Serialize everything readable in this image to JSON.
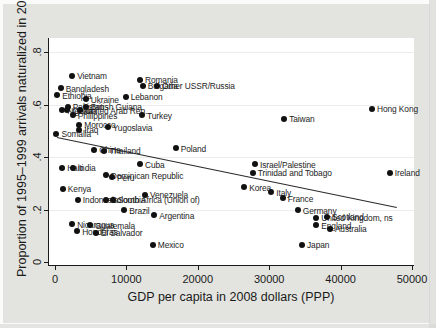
{
  "chart_data": {
    "type": "scatter",
    "title": "",
    "xlabel": "GDP per capita in 2008 dollars (PPP)",
    "ylabel": "Proportion of 1995–1999 arrivals naturalized in 2007",
    "xlim": [
      0,
      50000
    ],
    "ylim": [
      0,
      0.86
    ],
    "grid": "horizontal-faint",
    "x_ticks": {
      "values": [
        0,
        10000,
        20000,
        30000,
        40000,
        50000
      ],
      "labels": [
        "0",
        "10000",
        "20000",
        "30000",
        "40000",
        "50000"
      ]
    },
    "y_ticks": {
      "values": [
        0,
        0.2,
        0.4,
        0.6,
        0.8
      ],
      "labels": [
        "0",
        ".2",
        ".4",
        ".6",
        ".8"
      ]
    },
    "marker": {
      "shape": "filled-circle",
      "color": "#111111"
    },
    "points": [
      {
        "label": "Vietnam",
        "x": 2400,
        "y": 0.71
      },
      {
        "label": "Romania",
        "x": 11900,
        "y": 0.695
      },
      {
        "label": "Bulgaria",
        "x": 12300,
        "y": 0.672
      },
      {
        "label": "Other USSR/Russia",
        "x": 14300,
        "y": 0.672
      },
      {
        "label": "Bangladesh",
        "x": 800,
        "y": 0.664
      },
      {
        "label": "Ethiopia",
        "x": 300,
        "y": 0.637
      },
      {
        "label": "Ukraine",
        "x": 4300,
        "y": 0.622
      },
      {
        "label": "Lebanon",
        "x": 9900,
        "y": 0.63
      },
      {
        "label": "Pakistan",
        "x": 1800,
        "y": 0.592
      },
      {
        "label": "British Guiana",
        "x": 4300,
        "y": 0.592
      },
      {
        "label": "Nigeria",
        "x": 1000,
        "y": 0.58
      },
      {
        "label": "Ghana",
        "x": 1700,
        "y": 0.58
      },
      {
        "label": "United Arab Rep.",
        "x": 3500,
        "y": 0.58
      },
      {
        "label": "Philippines",
        "x": 2500,
        "y": 0.561
      },
      {
        "label": "Turkey",
        "x": 12200,
        "y": 0.561
      },
      {
        "label": "Morocco",
        "x": 3400,
        "y": 0.523
      },
      {
        "label": "Iraq",
        "x": 3400,
        "y": 0.504
      },
      {
        "label": "Yugoslavia",
        "x": 7400,
        "y": 0.515
      },
      {
        "label": "Somalia",
        "x": 200,
        "y": 0.489
      },
      {
        "label": "China",
        "x": 5500,
        "y": 0.428
      },
      {
        "label": "Thailand",
        "x": 6900,
        "y": 0.424
      },
      {
        "label": "Poland",
        "x": 16900,
        "y": 0.435
      },
      {
        "label": "Hong Kong",
        "x": 44400,
        "y": 0.584
      },
      {
        "label": "Taiwan",
        "x": 32100,
        "y": 0.546
      },
      {
        "label": "Cuba",
        "x": 11900,
        "y": 0.374
      },
      {
        "label": "Haiti",
        "x": 1000,
        "y": 0.359
      },
      {
        "label": "India",
        "x": 2500,
        "y": 0.359
      },
      {
        "label": "Dominican Republic",
        "x": 7100,
        "y": 0.332
      },
      {
        "label": "Peru",
        "x": 8000,
        "y": 0.324
      },
      {
        "label": "Israel/Palestine",
        "x": 28000,
        "y": 0.374
      },
      {
        "label": "Trinidad and Tobago",
        "x": 27700,
        "y": 0.34
      },
      {
        "label": "Ireland",
        "x": 46900,
        "y": 0.34
      },
      {
        "label": "Kenya",
        "x": 1100,
        "y": 0.279
      },
      {
        "label": "Korea",
        "x": 26500,
        "y": 0.286
      },
      {
        "label": "Italy",
        "x": 30300,
        "y": 0.267
      },
      {
        "label": "France",
        "x": 31900,
        "y": 0.244
      },
      {
        "label": "Indonesia",
        "x": 3200,
        "y": 0.237
      },
      {
        "label": "Colombia",
        "x": 7100,
        "y": 0.237
      },
      {
        "label": "South Africa (Union of)",
        "x": 8100,
        "y": 0.237
      },
      {
        "label": "Venezuela",
        "x": 12600,
        "y": 0.256
      },
      {
        "label": "Brazil",
        "x": 9700,
        "y": 0.198
      },
      {
        "label": "Argentina",
        "x": 13900,
        "y": 0.179
      },
      {
        "label": "Germany",
        "x": 34000,
        "y": 0.198
      },
      {
        "label": "United Kingdom, ns",
        "x": 36600,
        "y": 0.168
      },
      {
        "label": "Scotland",
        "x": 38100,
        "y": 0.172
      },
      {
        "label": "England",
        "x": 36600,
        "y": 0.141
      },
      {
        "label": "Australia",
        "x": 38500,
        "y": 0.126
      },
      {
        "label": "Nicaragua",
        "x": 2400,
        "y": 0.145
      },
      {
        "label": "Guatemala",
        "x": 4900,
        "y": 0.141
      },
      {
        "label": "Honduras",
        "x": 3100,
        "y": 0.118
      },
      {
        "label": "El Salvador",
        "x": 5700,
        "y": 0.111
      },
      {
        "label": "Mexico",
        "x": 13700,
        "y": 0.065
      },
      {
        "label": "Japan",
        "x": 34600,
        "y": 0.065
      }
    ],
    "trend_line": {
      "x1": 300,
      "y1": 0.477,
      "x2": 47900,
      "y2": 0.21
    }
  }
}
